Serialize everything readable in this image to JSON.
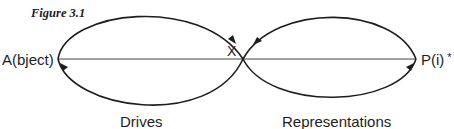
{
  "figure": {
    "caption": "Figure 3.1"
  },
  "diagram": {
    "nodes": {
      "left": "A(bject)",
      "center": "X",
      "right": "P(i)",
      "right_marker": "*"
    },
    "loops": [
      {
        "name": "left-loop",
        "label": "Drives",
        "flow": "clockwise: top arc from A toward X, bottom arc from X back to A"
      },
      {
        "name": "right-loop",
        "label": "Representations",
        "flow": "counter-clockwise: bottom arc from X toward P(i), top arc from P(i) back to X"
      }
    ],
    "stroke_color": "#1e1e1e",
    "axis_color": "#444444"
  }
}
